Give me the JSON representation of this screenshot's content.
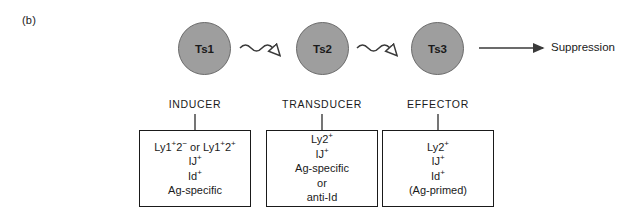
{
  "figure": {
    "panel_label": "(b)",
    "outcome": "Suppression"
  },
  "cells": [
    {
      "id": "ts1",
      "label": "Ts1",
      "fill": "#9e9e9e",
      "stroke": "#6b6b6b"
    },
    {
      "id": "ts2",
      "label": "Ts2",
      "fill": "#9e9e9e",
      "stroke": "#6b6b6b"
    },
    {
      "id": "ts3",
      "label": "Ts3",
      "fill": "#9e9e9e",
      "stroke": "#6b6b6b"
    }
  ],
  "stages": [
    {
      "id": "inducer",
      "label": "INDUCER",
      "phenotype": [
        {
          "base": "Ly1",
          "sup1": "+",
          "mid": "2",
          "sup2": "−",
          "tail": " or Ly1",
          "sup3": "+",
          "mid2": "2",
          "sup4": "+"
        },
        {
          "base": "IJ",
          "sup1": "+"
        },
        {
          "base": "Id",
          "sup1": "+"
        },
        {
          "base": "Ag-specific"
        }
      ],
      "phenotype_text": [
        "Ly1+2− or Ly1+2+",
        "IJ+",
        "Id+",
        "Ag-specific"
      ]
    },
    {
      "id": "transducer",
      "label": "TRANSDUCER",
      "phenotype_text": [
        "Ly2+",
        "IJ+",
        "Ag-specific",
        "or",
        "anti-Id"
      ]
    },
    {
      "id": "effector",
      "label": "EFFECTOR",
      "phenotype_text": [
        "Ly2+",
        "IJ+",
        "Id+",
        "(Ag-primed)"
      ]
    }
  ],
  "phenotype_inducer": {
    "line1_base": "Ly1",
    "line1_sup_a": "+",
    "line1_mid": "2",
    "line1_sup_b": "−",
    "line1_conj": " or Ly1",
    "line1_sup_c": "+",
    "line1_mid2": "2",
    "line1_sup_d": "+",
    "line2_base": "IJ",
    "line2_sup": "+",
    "line3_base": "Id",
    "line3_sup": "+",
    "line4": "Ag-specific"
  },
  "phenotype_transducer": {
    "line1_base": "Ly2",
    "line1_sup": "+",
    "line2_base": "IJ",
    "line2_sup": "+",
    "line3": "Ag-specific",
    "line4": "or",
    "line5": "anti-Id"
  },
  "phenotype_effector": {
    "line1_base": "Ly2",
    "line1_sup": "+",
    "line2_base": "IJ",
    "line2_sup": "+",
    "line3_base": "Id",
    "line3_sup": "+",
    "line4": "(Ag-primed)"
  },
  "arrows": [
    {
      "id": "ts1-to-ts2",
      "style": "wavy",
      "head": "open"
    },
    {
      "id": "ts2-to-ts3",
      "style": "wavy",
      "head": "open"
    },
    {
      "id": "ts3-to-suppression",
      "style": "straight",
      "head": "filled"
    }
  ],
  "colors": {
    "cell_fill": "#9e9e9e",
    "cell_stroke": "#6b6b6b",
    "line": "#3a3a3a",
    "box_border": "#1a1a1a",
    "text": "#1a1a1a",
    "background": "#ffffff"
  }
}
